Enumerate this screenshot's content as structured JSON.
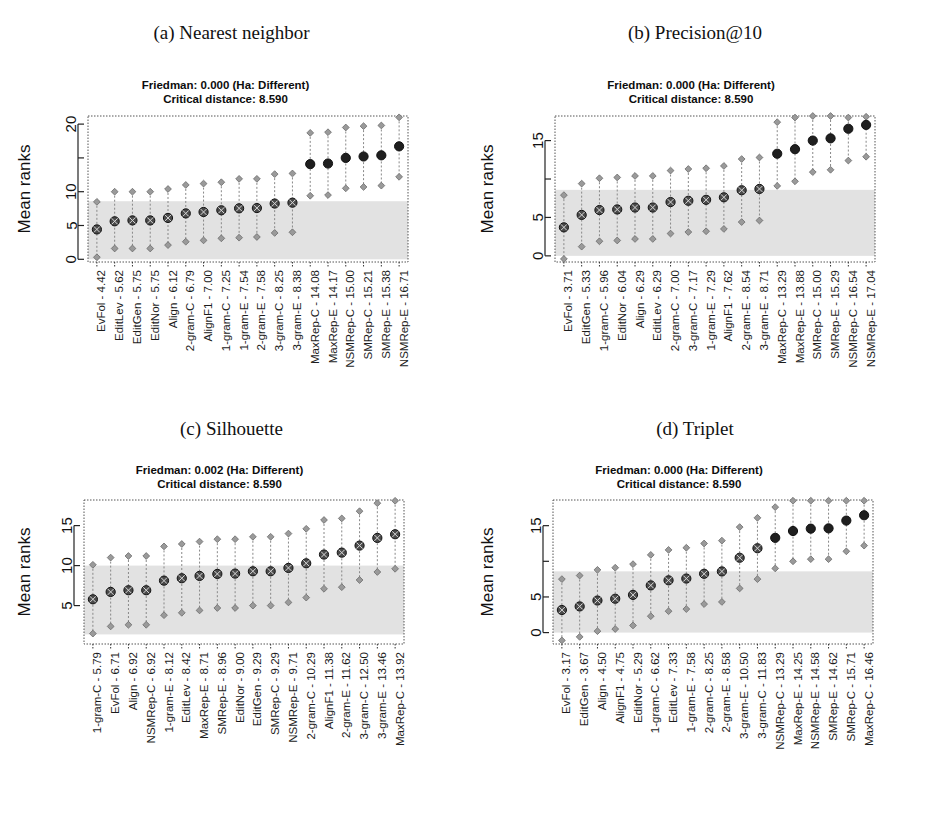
{
  "figure": {
    "width": 927,
    "height": 820,
    "band_color": "#e2e2e2",
    "point_color": "#4a4a4a",
    "point_dark_color": "#1f1f1f",
    "whisker_color": "#888888",
    "frame_color": "#555555",
    "critical_distance_label": "Critical distance: 8.590"
  },
  "panels": [
    {
      "key": "a",
      "caption": "(a) Nearest neighbor",
      "subtitle_line1": "Friedman: 0.000 (Ha: Different)",
      "subtitle_line2": "Critical distance: 8.590",
      "friedman_p": "0.000",
      "friedman_ha": "Different",
      "critical_distance": 8.59,
      "ylabel": "Mean ranks",
      "chart_data": {
        "type": "scatter",
        "title": "(a) Nearest neighbor",
        "xlabel": "",
        "ylabel": "Mean ranks",
        "ylim": [
          -0.4,
          21.2
        ],
        "yticks": [
          0,
          5,
          10,
          15,
          20
        ],
        "ytick_labels": [
          "0",
          "5",
          "10",
          "",
          "20"
        ],
        "grid": false,
        "band": [
          0,
          8.59
        ],
        "categories": [
          "EvFol - 4.42",
          "EditLev - 5.62",
          "EditGen - 5.75",
          "EditNor - 5.75",
          "Align - 6.12",
          "2-gram-C - 6.79",
          "AlignF1 - 7.00",
          "1-gram-C - 7.25",
          "1-gram-E - 7.54",
          "2-gram-E - 7.58",
          "3-gram-C - 8.25",
          "3-gram-E - 8.38",
          "MaxRep-C - 14.08",
          "MaxRep-E - 14.17",
          "NSMRep-C - 15.00",
          "SMRep-C - 15.21",
          "SMRep-E - 15.38",
          "NSMRep-E - 16.71"
        ],
        "values": [
          4.42,
          5.62,
          5.75,
          5.75,
          6.12,
          6.79,
          7.0,
          7.25,
          7.54,
          7.58,
          8.25,
          8.38,
          14.08,
          14.17,
          15.0,
          15.21,
          15.38,
          16.71
        ],
        "lower": [
          0.3,
          1.6,
          1.6,
          1.6,
          2.1,
          2.6,
          2.8,
          3.1,
          3.2,
          3.3,
          3.9,
          4.0,
          9.4,
          9.5,
          10.5,
          10.7,
          10.9,
          12.2
        ],
        "upper": [
          8.5,
          10.0,
          10.0,
          10.0,
          10.4,
          11.0,
          11.2,
          11.4,
          11.9,
          11.9,
          12.6,
          12.7,
          18.7,
          18.8,
          19.5,
          19.7,
          19.8,
          21.0
        ],
        "highlighted_from_index": 12
      }
    },
    {
      "key": "b",
      "caption": "(b) Precision@10",
      "subtitle_line1": "Friedman: 0.000 (Ha: Different)",
      "subtitle_line2": "Critical distance: 8.590",
      "friedman_p": "0.000",
      "friedman_ha": "Different",
      "critical_distance": 8.59,
      "ylabel": "Mean ranks",
      "chart_data": {
        "type": "scatter",
        "title": "(b) Precision@10",
        "xlabel": "",
        "ylabel": "Mean ranks",
        "ylim": [
          -0.8,
          18.2
        ],
        "yticks": [
          0,
          5,
          10,
          15
        ],
        "ytick_labels": [
          "0",
          "5",
          "",
          "15"
        ],
        "grid": false,
        "band": [
          0,
          8.59
        ],
        "categories": [
          "EvFol - 3.71",
          "EditGen - 5.33",
          "1-gram-C - 5.96",
          "EditNor - 6.04",
          "Align - 6.29",
          "EditLev - 6.29",
          "2-gram-C - 7.00",
          "3-gram-C - 7.17",
          "1-gram-E - 7.29",
          "AlignF1 - 7.62",
          "2-gram-E - 8.54",
          "3-gram-E - 8.71",
          "MaxRep-C - 13.29",
          "MaxRep-E - 13.88",
          "SMRep-C - 15.00",
          "SMRep-E - 15.29",
          "NSMRep-C - 16.54",
          "NSMRep-E - 17.04"
        ],
        "values": [
          3.71,
          5.33,
          5.96,
          6.04,
          6.29,
          6.29,
          7.0,
          7.17,
          7.29,
          7.62,
          8.54,
          8.71,
          13.29,
          13.88,
          15.0,
          15.29,
          16.54,
          17.04
        ],
        "lower": [
          -0.4,
          1.2,
          1.9,
          2.0,
          2.2,
          2.2,
          2.9,
          3.1,
          3.2,
          3.5,
          4.4,
          4.6,
          9.1,
          9.7,
          10.9,
          11.2,
          12.4,
          12.9
        ],
        "upper": [
          7.9,
          9.4,
          10.1,
          10.2,
          10.4,
          10.4,
          11.1,
          11.3,
          11.4,
          11.7,
          12.6,
          12.8,
          17.4,
          18.0,
          19.1,
          19.4,
          18.0,
          18.1
        ],
        "highlighted_from_index": 12
      }
    },
    {
      "key": "c",
      "caption": "(c) Silhouette",
      "subtitle_line1": "Friedman: 0.002 (Ha: Different)",
      "subtitle_line2": "Critical distance: 8.590",
      "friedman_p": "0.002",
      "friedman_ha": "Different",
      "critical_distance": 8.59,
      "ylabel": "Mean ranks",
      "chart_data": {
        "type": "scatter",
        "title": "(c) Silhouette",
        "xlabel": "",
        "ylabel": "Mean ranks",
        "ylim": [
          0.2,
          18.2
        ],
        "yticks": [
          5,
          10,
          15
        ],
        "ytick_labels": [
          "5",
          "10",
          "15"
        ],
        "grid": false,
        "band": [
          1.4,
          10.0
        ],
        "categories": [
          "1-gram-C - 5.79",
          "EvFol - 6.71",
          "Align - 6.92",
          "NSMRep-C - 6.92",
          "1-gram-E - 8.12",
          "EditLev - 8.42",
          "MaxRep-E - 8.71",
          "SMRep-E - 8.96",
          "EditNor - 9.00",
          "EditGen - 9.29",
          "SMRep-C - 9.29",
          "NSMRep-E - 9.71",
          "2-gram-C - 10.29",
          "AlignF1 - 11.38",
          "2-gram-E - 11.62",
          "3-gram-C - 12.50",
          "3-gram-E - 13.46",
          "MaxRep-C - 13.92"
        ],
        "values": [
          5.79,
          6.71,
          6.92,
          6.92,
          8.12,
          8.42,
          8.71,
          8.96,
          9.0,
          9.29,
          9.29,
          9.71,
          10.29,
          11.38,
          11.62,
          12.5,
          13.46,
          13.92
        ],
        "lower": [
          1.5,
          2.4,
          2.6,
          2.6,
          3.8,
          4.1,
          4.4,
          4.7,
          4.7,
          5.0,
          5.0,
          5.4,
          6.0,
          7.1,
          7.3,
          8.2,
          9.2,
          9.6
        ],
        "upper": [
          10.1,
          11.0,
          11.2,
          11.2,
          12.4,
          12.7,
          13.0,
          13.3,
          13.3,
          13.6,
          13.6,
          14.0,
          14.6,
          15.7,
          15.9,
          16.8,
          17.8,
          18.1
        ],
        "highlighted_from_index": 18
      }
    },
    {
      "key": "d",
      "caption": "(d) Triplet",
      "subtitle_line1": "Friedman: 0.000 (Ha: Different)",
      "subtitle_line2": "Critical distance: 8.590",
      "friedman_p": "0.000",
      "friedman_ha": "Different",
      "critical_distance": 8.59,
      "ylabel": "Mean ranks",
      "chart_data": {
        "type": "scatter",
        "title": "(d) Triplet",
        "xlabel": "",
        "ylabel": "Mean ranks",
        "ylim": [
          -1.6,
          18.6
        ],
        "yticks": [
          0,
          5,
          10,
          15
        ],
        "ytick_labels": [
          "0",
          "5",
          "",
          "15"
        ],
        "grid": false,
        "band": [
          0,
          8.59
        ],
        "categories": [
          "EvFol - 3.17",
          "EditGen - 3.67",
          "Align - 4.50",
          "AlignF1 - 4.75",
          "EditNor - 5.29",
          "1-gram-C - 6.62",
          "EditLev - 7.33",
          "1-gram-E - 7.58",
          "2-gram-C - 8.25",
          "2-gram-E - 8.58",
          "3-gram-E - 10.50",
          "3-gram-C - 11.83",
          "NSMRep-C - 13.29",
          "MaxRep-E - 14.25",
          "NSMRep-E - 14.58",
          "SMRep-E - 14.62",
          "SMRep-C - 15.71",
          "MaxRep-C - 16.46"
        ],
        "values": [
          3.17,
          3.67,
          4.5,
          4.75,
          5.29,
          6.62,
          7.33,
          7.58,
          8.25,
          8.58,
          10.5,
          11.83,
          13.29,
          14.25,
          14.58,
          14.62,
          15.71,
          16.46
        ],
        "lower": [
          -1.1,
          -0.6,
          0.2,
          0.5,
          1.0,
          2.3,
          3.0,
          3.3,
          4.0,
          4.3,
          6.2,
          7.5,
          9.0,
          10.0,
          10.3,
          10.3,
          11.4,
          12.2
        ],
        "upper": [
          7.5,
          8.0,
          8.8,
          9.1,
          9.6,
          10.9,
          11.6,
          11.9,
          12.5,
          12.9,
          14.8,
          16.1,
          17.6,
          18.5,
          18.5,
          18.5,
          18.5,
          18.5
        ],
        "highlighted_from_index": 12
      }
    }
  ]
}
